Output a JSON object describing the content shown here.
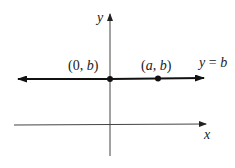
{
  "figure": {
    "axes": {
      "x_label": "x",
      "y_label": "y"
    },
    "line": {
      "equation_label": "y = b",
      "equation_lhs": "y",
      "equation_eq": " = ",
      "equation_rhs": "b"
    },
    "points": [
      {
        "label": "(0, b)",
        "open": "(",
        "first": "0",
        "sep": ", ",
        "second": "b",
        "close": ")"
      },
      {
        "label": "(a, b)",
        "open": "(",
        "first": "a",
        "sep": ", ",
        "second": "b",
        "close": ")"
      }
    ],
    "colors": {
      "line": "#111111",
      "axis": "#333333",
      "text": "#222222"
    }
  }
}
